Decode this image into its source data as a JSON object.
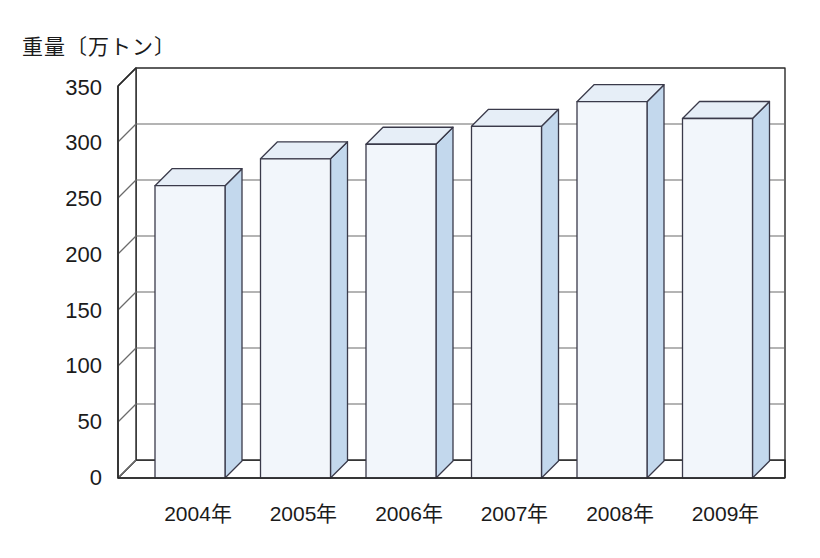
{
  "chart_data": {
    "type": "bar",
    "title": "",
    "ylabel": "重量〔万トン〕",
    "xlabel": "",
    "categories": [
      "2004年",
      "2005年",
      "2006年",
      "2007年",
      "2008年",
      "2009年"
    ],
    "values": [
      261,
      285,
      298,
      314,
      336,
      321
    ],
    "yticks": [
      0,
      50,
      100,
      150,
      200,
      250,
      300,
      350
    ],
    "ylim": [
      0,
      350
    ],
    "grid": true,
    "legend": "none",
    "style": "3d-column",
    "colors": {
      "bar_front": "#f2f6fb",
      "bar_side": "#c3d8ed",
      "bar_top": "#e6eef7",
      "outline": "#3a3a4a",
      "grid_line": "#6b6b6b",
      "axis_line": "#2a2a2a",
      "background": "#ffffff"
    }
  }
}
